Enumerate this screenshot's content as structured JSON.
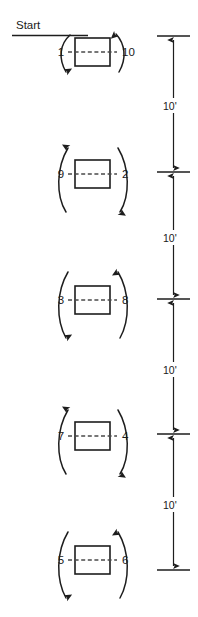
{
  "diagram": {
    "title_label": "Start",
    "stations": [
      {
        "id": "station-1",
        "left_cone": "1",
        "right_cone": "10",
        "left_arrow_direction": "down",
        "right_arrow_direction": "up",
        "box_center_y": 52
      },
      {
        "id": "station-2",
        "left_cone": "9",
        "right_cone": "2",
        "left_arrow_direction": "up",
        "right_arrow_direction": "down",
        "box_center_y": 174
      },
      {
        "id": "station-3",
        "left_cone": "3",
        "right_cone": "8",
        "left_arrow_direction": "down",
        "right_arrow_direction": "up",
        "box_center_y": 300
      },
      {
        "id": "station-4",
        "left_cone": "7",
        "right_cone": "4",
        "left_arrow_direction": "up",
        "right_arrow_direction": "down",
        "box_center_y": 436
      },
      {
        "id": "station-5",
        "left_cone": "5",
        "right_cone": "6",
        "left_arrow_direction": "down",
        "right_arrow_direction": "up",
        "box_center_y": 560
      }
    ],
    "dimensions": [
      {
        "id": "dim-1",
        "label": "10'",
        "top_y": 36,
        "bottom_y": 172,
        "label_y": 106
      },
      {
        "id": "dim-2",
        "label": "10'",
        "top_y": 172,
        "bottom_y": 299,
        "label_y": 238
      },
      {
        "id": "dim-3",
        "label": "10'",
        "top_y": 299,
        "bottom_y": 434,
        "label_y": 370
      },
      {
        "id": "dim-4",
        "label": "10'",
        "top_y": 434,
        "bottom_y": 570,
        "label_y": 505
      }
    ],
    "colors": {
      "ink": "#1d1d1d",
      "dash": "#4a4a4a",
      "background": "#ffffff"
    }
  }
}
